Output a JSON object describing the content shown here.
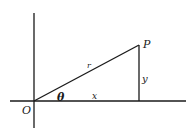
{
  "diagram": {
    "type": "polar-coordinates",
    "labels": {
      "origin": "O",
      "point": "P",
      "angle": "θ",
      "radius": "r",
      "x_leg": "x",
      "y_leg": "y"
    },
    "colors": {
      "line": "#1a1a1a",
      "background": "#ffffff"
    }
  }
}
